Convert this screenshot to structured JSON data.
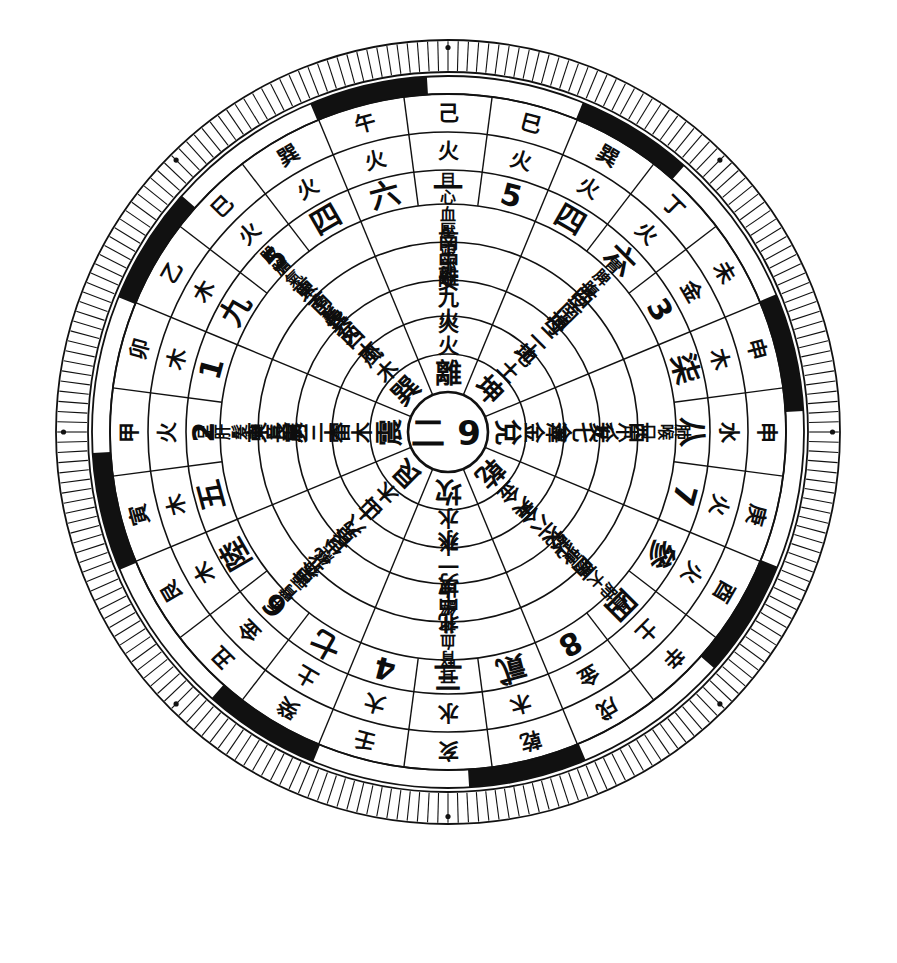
{
  "figure": {
    "center_label_left": "二",
    "center_label_right": "9",
    "ink_color": "#111111",
    "paper_color": "#ffffff"
  },
  "rings": {
    "r1_trigram": {
      "name": "trigram-ring",
      "cells": [
        "艮",
        "震",
        "巽",
        "離",
        "坤",
        "兌",
        "乾",
        "坎"
      ]
    },
    "r2_element": {
      "name": "trigram-element-ring",
      "cells": [
        "山木",
        "雷木",
        "風木",
        "火火",
        "地土",
        "澤金",
        "天金",
        "水水"
      ]
    },
    "r3_number_element": {
      "name": "number-element-ring",
      "cells": [
        "艮八土",
        "震三木",
        "巽四木",
        "離九火",
        "坤二土",
        "兌七金",
        "乾六金",
        "坎一水"
      ]
    },
    "r4_family": {
      "name": "family-direction-ring",
      "cells": [
        "東北少男",
        "東長男",
        "東南長女",
        "南中女",
        "西南母",
        "西少女",
        "西北父",
        "北中男"
      ]
    },
    "r5_body": {
      "name": "body-part-ring",
      "cells": [
        "手臂頭神經",
        "足肝髮聲音",
        "股膽氣管毛髮",
        "目心血壓頭部",
        "胃脾腹皮",
        "肺喉口舌",
        "骨肺大腸頭",
        "耳腎血神經"
      ]
    },
    "r6_number": {
      "name": "outer-number-ring",
      "cells": [
        "五",
        "2",
        "1",
        "一",
        "5",
        "四",
        "3",
        "柒",
        "八",
        "7",
        "參",
        "四",
        "土",
        "8",
        "貳",
        "三",
        "4",
        "七",
        "6",
        "陸"
      ]
    },
    "r7_element": {
      "name": "outer-element-ring",
      "cells": [
        "木",
        "火",
        "木",
        "火",
        "火",
        "火",
        "金",
        "木",
        "水",
        "火",
        "火",
        "土",
        "土",
        "金",
        "木",
        "水",
        "大",
        "土",
        "金",
        "木"
      ]
    },
    "r8_stembranch": {
      "name": "stem-branch-ring",
      "cells": [
        "寅",
        "甲",
        "卯",
        "乙",
        "巳",
        "巽",
        "未",
        "申",
        "申",
        "庚",
        "酉",
        "辛",
        "辛",
        "戌",
        "乾",
        "亥",
        "壬",
        "癸",
        "丑",
        "艮"
      ]
    }
  },
  "outer_24": {
    "name": "twenty-four-mountain-ring",
    "sectors": [
      {
        "number": "一",
        "element": "火",
        "stem": "己"
      },
      {
        "number": "5",
        "element": "火",
        "stem": "巳"
      },
      {
        "number": "四",
        "element": "火",
        "stem": "巽"
      },
      {
        "number": "六",
        "element": "火",
        "stem": "丁"
      },
      {
        "number": "3",
        "element": "金",
        "stem": "未"
      },
      {
        "number": "柒",
        "element": "木",
        "stem": "申"
      },
      {
        "number": "八",
        "element": "水",
        "stem": "申"
      },
      {
        "number": "7",
        "element": "火",
        "stem": "庚"
      },
      {
        "number": "參",
        "element": "火",
        "stem": "酉"
      },
      {
        "number": "四",
        "element": "土",
        "stem": "辛"
      },
      {
        "number": "8",
        "element": "金",
        "stem": "戌"
      },
      {
        "number": "貳",
        "element": "木",
        "stem": "乾"
      },
      {
        "number": "三",
        "element": "水",
        "stem": "亥"
      },
      {
        "number": "4",
        "element": "大",
        "stem": "壬"
      },
      {
        "number": "七",
        "element": "土",
        "stem": "癸"
      },
      {
        "number": "6",
        "element": "金",
        "stem": "丑"
      },
      {
        "number": "陸",
        "element": "木",
        "stem": "艮"
      },
      {
        "number": "五",
        "element": "木",
        "stem": "寅"
      },
      {
        "number": "2",
        "element": "火",
        "stem": "甲"
      },
      {
        "number": "1",
        "element": "木",
        "stem": "卯"
      },
      {
        "number": "九",
        "element": "木",
        "stem": "乙"
      },
      {
        "number": "5",
        "element": "火",
        "stem": "巳"
      },
      {
        "number": "四",
        "element": "火",
        "stem": "巽"
      },
      {
        "number": "六",
        "element": "火",
        "stem": "午"
      }
    ]
  },
  "segment_ring": {
    "name": "black-white-segment-ring",
    "pattern_black_indices": [
      1,
      3,
      5,
      7,
      9,
      11,
      13,
      15
    ]
  },
  "tick_ring": {
    "name": "graduation-tick-ring",
    "tick_count": 240,
    "marker_dot_count": 8
  }
}
